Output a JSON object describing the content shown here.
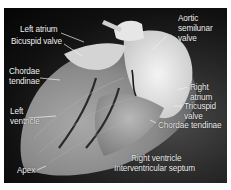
{
  "figure": {
    "labels": {
      "left_atrium": "Left atrium",
      "bicuspid_valve": "Bicuspid valve",
      "chordae_left_1": "Chordae",
      "chordae_left_2": "tendinae",
      "left_ventricle_1": "Left",
      "left_ventricle_2": "ventricle",
      "apex": "Apex",
      "aortic_1": "Aortic",
      "aortic_2": "semilunar",
      "aortic_3": "valve",
      "right_atrium_1": "Right",
      "right_atrium_2": "atrium",
      "tricuspid_1": "Tricuspid",
      "tricuspid_2": "valve",
      "chordae_right": "Chordae tendinae",
      "right_ventricle": "Right ventricle",
      "septum": "Interventricular septum"
    },
    "colors": {
      "background": "#ffffff",
      "photo_dark": "#080808",
      "tissue_light": "#d8d8d8",
      "label_text": "#f2f2f2"
    }
  }
}
